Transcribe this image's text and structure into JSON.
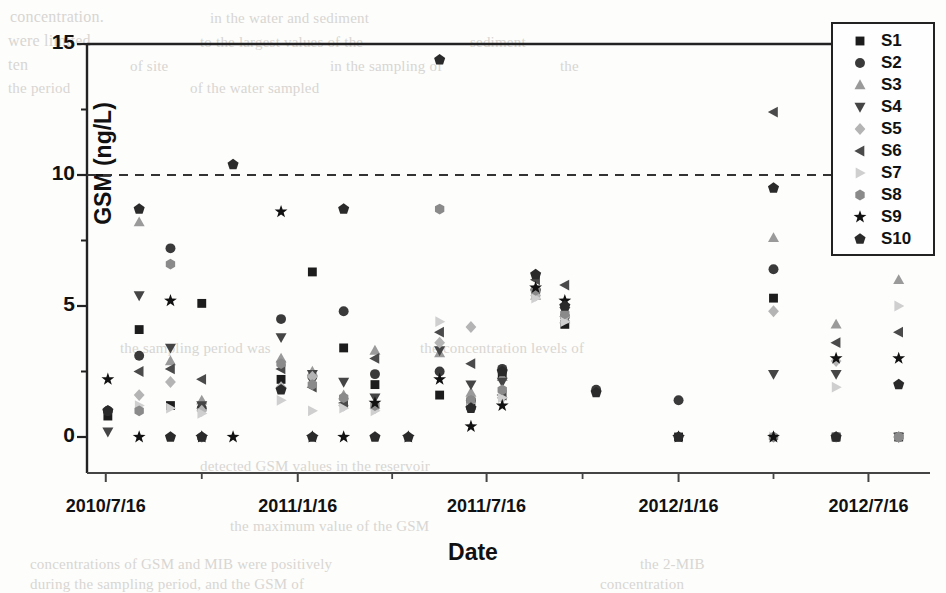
{
  "figure": {
    "axis_y_title": "GSM (ng/L)",
    "axis_x_title": "Date"
  },
  "legend": {
    "entries": [
      {
        "label": "S1",
        "marker": "square",
        "color": "#1c1c1c"
      },
      {
        "label": "S2",
        "marker": "circle",
        "color": "#3a3a3a"
      },
      {
        "label": "S3",
        "marker": "triangle-up",
        "color": "#9a9a9a"
      },
      {
        "label": "S4",
        "marker": "triangle-down",
        "color": "#454545"
      },
      {
        "label": "S5",
        "marker": "diamond",
        "color": "#b4b4b4"
      },
      {
        "label": "S6",
        "marker": "triangle-left",
        "color": "#4a4a4a"
      },
      {
        "label": "S7",
        "marker": "triangle-right",
        "color": "#cfcfcf"
      },
      {
        "label": "S8",
        "marker": "hexagon",
        "color": "#8a8a8a"
      },
      {
        "label": "S9",
        "marker": "star",
        "color": "#111111"
      },
      {
        "label": "S10",
        "marker": "pentagon",
        "color": "#2a2a2a"
      }
    ]
  },
  "ghost_text": [
    {
      "text": "concentration.",
      "x": 10,
      "y": 8,
      "size": 16
    },
    {
      "text": "in the water and sediment",
      "x": 210,
      "y": 10,
      "size": 15
    },
    {
      "text": "were limited",
      "x": 8,
      "y": 32,
      "size": 16
    },
    {
      "text": "to the largest values of the",
      "x": 200,
      "y": 34,
      "size": 15
    },
    {
      "text": "sediment",
      "x": 470,
      "y": 34,
      "size": 15
    },
    {
      "text": "ten",
      "x": 8,
      "y": 56,
      "size": 16
    },
    {
      "text": "of site",
      "x": 130,
      "y": 58,
      "size": 15
    },
    {
      "text": "in the sampling of",
      "x": 330,
      "y": 58,
      "size": 15
    },
    {
      "text": "the",
      "x": 560,
      "y": 58,
      "size": 15
    },
    {
      "text": "the period",
      "x": 8,
      "y": 80,
      "size": 15
    },
    {
      "text": "of the water sampled",
      "x": 190,
      "y": 80,
      "size": 15
    },
    {
      "text": "the sampling period was",
      "x": 120,
      "y": 340,
      "size": 15
    },
    {
      "text": "the concentration levels of",
      "x": 420,
      "y": 340,
      "size": 15
    },
    {
      "text": "detected GSM values in the reservoir",
      "x": 200,
      "y": 458,
      "size": 15
    },
    {
      "text": "the maximum value of the GSM",
      "x": 230,
      "y": 518,
      "size": 15
    },
    {
      "text": "concentrations of GSM and MIB were positively",
      "x": 30,
      "y": 556,
      "size": 15
    },
    {
      "text": "the 2-MIB",
      "x": 640,
      "y": 556,
      "size": 15
    },
    {
      "text": "during the sampling period, and the GSM of",
      "x": 30,
      "y": 576,
      "size": 15
    },
    {
      "text": "concentration",
      "x": 600,
      "y": 576,
      "size": 15
    }
  ],
  "chart_data": {
    "type": "scatter",
    "title": "",
    "xlabel": "Date",
    "ylabel": "GSM (ng/L)",
    "ylim": [
      0,
      15
    ],
    "yticks": [
      0,
      5,
      10,
      15
    ],
    "yminorticks": [
      2.5,
      7.5,
      12.5
    ],
    "xticklabels": [
      "2010/7/16",
      "2011/1/16",
      "2011/7/16",
      "2012/1/16",
      "2012/7/16"
    ],
    "xtick_days": [
      0,
      184,
      365,
      549,
      731
    ],
    "xlim_days": [
      -18,
      790
    ],
    "grid": false,
    "legend_position": "top-right",
    "threshold_line": {
      "value": 10,
      "style": "dashed",
      "color": "#333333"
    },
    "series": [
      {
        "name": "S1",
        "marker": "square",
        "color": "#1c1c1c",
        "points": [
          [
            2,
            0.8
          ],
          [
            32,
            4.1
          ],
          [
            62,
            1.2
          ],
          [
            92,
            5.1
          ],
          [
            168,
            2.2
          ],
          [
            198,
            6.3
          ],
          [
            228,
            3.4
          ],
          [
            258,
            2.0
          ],
          [
            320,
            1.6
          ],
          [
            350,
            1.2
          ],
          [
            380,
            2.4
          ],
          [
            412,
            5.5
          ],
          [
            440,
            4.3
          ],
          [
            549,
            0.0
          ],
          [
            640,
            5.3
          ],
          [
            700,
            0.0
          ],
          [
            760,
            0.0
          ]
        ]
      },
      {
        "name": "S2",
        "marker": "circle",
        "color": "#3a3a3a",
        "points": [
          [
            2,
            1.0
          ],
          [
            32,
            3.1
          ],
          [
            62,
            7.2
          ],
          [
            92,
            1.1
          ],
          [
            168,
            4.5
          ],
          [
            198,
            2.3
          ],
          [
            228,
            4.8
          ],
          [
            258,
            2.4
          ],
          [
            320,
            2.5
          ],
          [
            350,
            1.4
          ],
          [
            380,
            2.6
          ],
          [
            412,
            5.6
          ],
          [
            440,
            4.6
          ],
          [
            470,
            1.8
          ],
          [
            549,
            1.4
          ],
          [
            640,
            6.4
          ],
          [
            700,
            0.0
          ],
          [
            760,
            0.0
          ]
        ]
      },
      {
        "name": "S3",
        "marker": "triangle-up",
        "color": "#9a9a9a",
        "points": [
          [
            32,
            8.2
          ],
          [
            62,
            2.9
          ],
          [
            92,
            1.4
          ],
          [
            168,
            3.0
          ],
          [
            198,
            2.5
          ],
          [
            228,
            1.6
          ],
          [
            258,
            3.3
          ],
          [
            320,
            3.2
          ],
          [
            350,
            1.7
          ],
          [
            380,
            2.3
          ],
          [
            412,
            5.4
          ],
          [
            440,
            4.5
          ],
          [
            640,
            7.6
          ],
          [
            700,
            4.3
          ],
          [
            760,
            6.0
          ]
        ]
      },
      {
        "name": "S4",
        "marker": "triangle-down",
        "color": "#454545",
        "points": [
          [
            2,
            0.2
          ],
          [
            32,
            5.4
          ],
          [
            62,
            3.4
          ],
          [
            92,
            1.2
          ],
          [
            168,
            3.8
          ],
          [
            198,
            2.4
          ],
          [
            228,
            2.1
          ],
          [
            258,
            1.5
          ],
          [
            320,
            3.3
          ],
          [
            350,
            2.0
          ],
          [
            380,
            2.1
          ],
          [
            412,
            5.5
          ],
          [
            440,
            4.8
          ],
          [
            640,
            2.4
          ],
          [
            700,
            2.4
          ],
          [
            760,
            0.0
          ]
        ]
      },
      {
        "name": "S5",
        "marker": "diamond",
        "color": "#b4b4b4",
        "points": [
          [
            32,
            1.6
          ],
          [
            62,
            2.1
          ],
          [
            92,
            1.0
          ],
          [
            168,
            1.9
          ],
          [
            198,
            2.3
          ],
          [
            228,
            1.2
          ],
          [
            258,
            1.1
          ],
          [
            320,
            3.6
          ],
          [
            350,
            4.2
          ],
          [
            380,
            1.5
          ],
          [
            412,
            5.4
          ],
          [
            440,
            4.6
          ],
          [
            640,
            4.8
          ],
          [
            700,
            2.9
          ],
          [
            760,
            0.0
          ]
        ]
      },
      {
        "name": "S6",
        "marker": "triangle-left",
        "color": "#4a4a4a",
        "points": [
          [
            32,
            2.5
          ],
          [
            62,
            2.6
          ],
          [
            92,
            2.2
          ],
          [
            168,
            2.6
          ],
          [
            198,
            1.9
          ],
          [
            228,
            1.3
          ],
          [
            258,
            3.0
          ],
          [
            320,
            4.0
          ],
          [
            350,
            2.8
          ],
          [
            380,
            1.6
          ],
          [
            412,
            6.0
          ],
          [
            440,
            5.8
          ],
          [
            640,
            12.4
          ],
          [
            700,
            3.6
          ],
          [
            760,
            4.0
          ]
        ]
      },
      {
        "name": "S7",
        "marker": "triangle-right",
        "color": "#cfcfcf",
        "points": [
          [
            32,
            1.2
          ],
          [
            62,
            1.1
          ],
          [
            92,
            0.9
          ],
          [
            168,
            1.4
          ],
          [
            198,
            1.0
          ],
          [
            228,
            1.1
          ],
          [
            258,
            1.0
          ],
          [
            320,
            4.4
          ],
          [
            350,
            1.3
          ],
          [
            380,
            1.5
          ],
          [
            412,
            5.3
          ],
          [
            440,
            4.4
          ],
          [
            640,
            0.0
          ],
          [
            700,
            1.9
          ],
          [
            760,
            5.0
          ]
        ]
      },
      {
        "name": "S8",
        "marker": "hexagon",
        "color": "#8a8a8a",
        "points": [
          [
            32,
            1.0
          ],
          [
            62,
            6.6
          ],
          [
            92,
            0.0
          ],
          [
            168,
            2.8
          ],
          [
            198,
            2.0
          ],
          [
            228,
            1.5
          ],
          [
            258,
            1.2
          ],
          [
            320,
            8.7
          ],
          [
            350,
            1.4
          ],
          [
            380,
            1.8
          ],
          [
            412,
            5.6
          ],
          [
            440,
            4.7
          ],
          [
            640,
            0.0
          ],
          [
            700,
            0.0
          ],
          [
            760,
            0.0
          ]
        ]
      },
      {
        "name": "S9",
        "marker": "star",
        "color": "#111111",
        "points": [
          [
            2,
            2.2
          ],
          [
            32,
            0.0
          ],
          [
            62,
            5.2
          ],
          [
            92,
            0.0
          ],
          [
            122,
            0.0
          ],
          [
            168,
            8.6
          ],
          [
            198,
            0.0
          ],
          [
            228,
            0.0
          ],
          [
            258,
            1.3
          ],
          [
            290,
            0.0
          ],
          [
            320,
            2.2
          ],
          [
            350,
            0.4
          ],
          [
            380,
            1.2
          ],
          [
            412,
            5.7
          ],
          [
            440,
            5.2
          ],
          [
            549,
            0.0
          ],
          [
            640,
            0.0
          ],
          [
            700,
            3.0
          ],
          [
            760,
            3.0
          ]
        ]
      },
      {
        "name": "S10",
        "marker": "pentagon",
        "color": "#2a2a2a",
        "points": [
          [
            2,
            1.0
          ],
          [
            32,
            8.7
          ],
          [
            62,
            0.0
          ],
          [
            92,
            0.0
          ],
          [
            122,
            10.4
          ],
          [
            168,
            1.8
          ],
          [
            198,
            0.0
          ],
          [
            228,
            8.7
          ],
          [
            258,
            0.0
          ],
          [
            290,
            0.0
          ],
          [
            320,
            14.4
          ],
          [
            350,
            1.1
          ],
          [
            380,
            2.5
          ],
          [
            412,
            6.2
          ],
          [
            440,
            5.0
          ],
          [
            470,
            1.7
          ],
          [
            549,
            0.0
          ],
          [
            640,
            9.5
          ],
          [
            700,
            0.0
          ],
          [
            760,
            2.0
          ]
        ]
      }
    ]
  }
}
